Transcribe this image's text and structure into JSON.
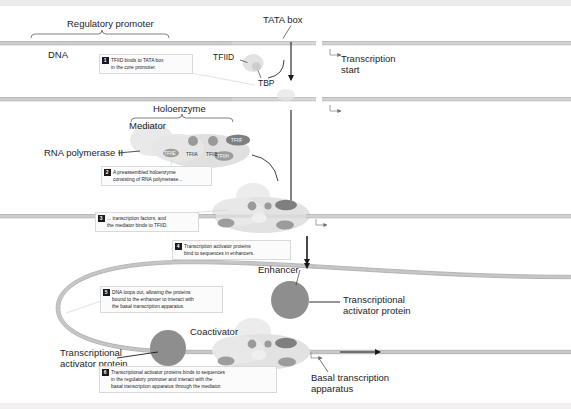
{
  "figure": {
    "type": "biology-process-diagram"
  },
  "labels": {
    "regulatory_promoter": "Regulatory promoter",
    "tata_box": "TATA box",
    "dna": "DNA",
    "tfiid": "TFIID",
    "tbp": "TBP",
    "transcription_start": "Transcription\nstart",
    "holoenzyme": "Holoenzyme",
    "mediator": "Mediator",
    "rna_polymerase_ii": "RNA polymerase II",
    "enhancer": "Enhancer",
    "coactivator": "Coactivator",
    "transcriptional_activator_protein_right": "Transcriptional\nactivator protein",
    "transcriptional_activator_protein_left": "Transcriptional\nactivator protein",
    "basal_transcription_apparatus": "Basal transcription\napparatus"
  },
  "factors": [
    {
      "name": "TFIIA",
      "shape": "circle",
      "tone": "mid"
    },
    {
      "name": "TFIIB",
      "shape": "circle",
      "tone": "mid"
    },
    {
      "name": "TFIIE",
      "shape": "ellipse",
      "tone": "mid"
    },
    {
      "name": "TFIIF",
      "shape": "ellipse",
      "tone": "dark"
    },
    {
      "name": "TFIIH",
      "shape": "ellipse",
      "tone": "mid"
    }
  ],
  "steps": [
    {
      "number": "1",
      "text": "TFIID binds to TATA box\nin the core promoter."
    },
    {
      "number": "2",
      "text": "A preassembled holoenzyme\nconsisting of RNA polymerase..."
    },
    {
      "number": "3",
      "text": "... transcription factors, and\nthe mediator binds to TFIID."
    },
    {
      "number": "4",
      "text": "Transcription activator proteins\nbind to sequences in enhancers."
    },
    {
      "number": "5",
      "text": "DNA loops out, allowing the proteins\nbound to the enhancer to interact with\nthe basal transcription apparatus."
    },
    {
      "number": "6",
      "text": "Transcriptional activator proteins binds to sequences\nin the regulatory promoter and interact with the\nbasal transcription apparatus through the mediator."
    }
  ],
  "colors": {
    "dna_strand": "#b9b9b9",
    "dna_promoter": "#cfcfcf",
    "activator": "#8e8e8e",
    "factor_mid": "#9a9a9a",
    "factor_dark": "#7d7d7d",
    "complex_fill": "#e4e4e4",
    "mediator_fill": "#ededed",
    "text": "#1d1d1d",
    "page": "#ffffff"
  }
}
